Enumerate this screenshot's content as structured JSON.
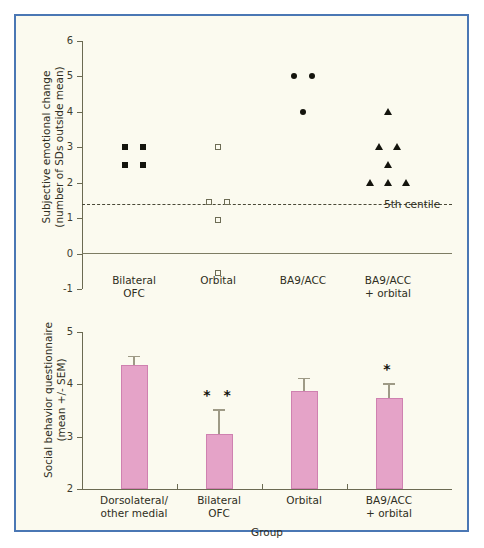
{
  "figure": {
    "background_color": "#fbfaef",
    "border_color": "#4a77b4",
    "bar_color": "#e5a3c8"
  },
  "chart_data": [
    {
      "type": "scatter",
      "title": "",
      "xlabel": "",
      "ylabel": "Subjective emotional change (number of SDs outside mean)",
      "ylabel_line1": "Subjective emotional change",
      "ylabel_line2": "(number of SDs outside mean)",
      "ylim": [
        -1,
        6
      ],
      "yticks": [
        6,
        5,
        4,
        3,
        2,
        1,
        0,
        -1
      ],
      "ytick_labels": [
        "6",
        "5",
        "4",
        "3",
        "2",
        "1",
        "0",
        "-1"
      ],
      "grid": false,
      "categories": [
        "Bilateral OFC",
        "Orbital",
        "BA9/ACC",
        "BA9/ACC + orbital"
      ],
      "category_labels": [
        {
          "line1": "Bilateral",
          "line2": "OFC"
        },
        {
          "line1": "Orbital",
          "line2": ""
        },
        {
          "line1": "BA9/ACC",
          "line2": ""
        },
        {
          "line1": "BA9/ACC",
          "line2": "+ orbital"
        }
      ],
      "annotations": [
        {
          "text": "5th centile",
          "y": 1.7,
          "type": "dashed-reference-line"
        }
      ],
      "reference_line_value": 1.7,
      "zero_line_value": 0,
      "series": [
        {
          "name": "Bilateral OFC",
          "marker": "filled-square",
          "points": [
            {
              "x": 1,
              "y": 3.0,
              "offset": -1
            },
            {
              "x": 1,
              "y": 3.0,
              "offset": 1
            },
            {
              "x": 1,
              "y": 2.5,
              "offset": -1
            },
            {
              "x": 1,
              "y": 2.5,
              "offset": 1
            }
          ]
        },
        {
          "name": "Orbital",
          "marker": "open-square",
          "points": [
            {
              "x": 2,
              "y": 3.0,
              "offset": 0
            },
            {
              "x": 2,
              "y": 1.45,
              "offset": -1
            },
            {
              "x": 2,
              "y": 1.45,
              "offset": 1
            },
            {
              "x": 2,
              "y": 0.95,
              "offset": 0
            },
            {
              "x": 2,
              "y": -0.55,
              "offset": 0
            }
          ]
        },
        {
          "name": "BA9/ACC",
          "marker": "filled-circle",
          "points": [
            {
              "x": 3,
              "y": 5.0,
              "offset": -1
            },
            {
              "x": 3,
              "y": 5.0,
              "offset": 1
            },
            {
              "x": 3,
              "y": 4.0,
              "offset": 0
            }
          ]
        },
        {
          "name": "BA9/ACC + orbital",
          "marker": "filled-triangle",
          "points": [
            {
              "x": 4,
              "y": 4.0,
              "offset": 0
            },
            {
              "x": 4,
              "y": 3.0,
              "offset": -1
            },
            {
              "x": 4,
              "y": 3.0,
              "offset": 1
            },
            {
              "x": 4,
              "y": 2.5,
              "offset": 0
            },
            {
              "x": 4,
              "y": 2.0,
              "offset": -2
            },
            {
              "x": 4,
              "y": 2.0,
              "offset": 0
            },
            {
              "x": 4,
              "y": 2.0,
              "offset": 2
            }
          ]
        }
      ]
    },
    {
      "type": "bar",
      "title": "",
      "xlabel": "Group",
      "ylabel": "Social behavior questionnaire (mean +/- SEM)",
      "ylabel_line1": "Social behavior questionnaire",
      "ylabel_line2": "(mean +/- SEM)",
      "ylim": [
        2,
        5
      ],
      "yticks": [
        5,
        4,
        3,
        2
      ],
      "ytick_labels": [
        "5",
        "4",
        "3",
        "2"
      ],
      "grid": false,
      "categories": [
        "Dorsolateral/other medial",
        "Bilateral OFC",
        "Orbital",
        "BA9/ACC + orbital"
      ],
      "category_labels": [
        {
          "line1": "Dorsolateral/",
          "line2": "other medial"
        },
        {
          "line1": "Bilateral",
          "line2": "OFC"
        },
        {
          "line1": "Orbital",
          "line2": ""
        },
        {
          "line1": "BA9/ACC",
          "line2": "+ orbital"
        }
      ],
      "values": [
        4.36,
        3.06,
        3.87,
        3.73
      ],
      "errors": [
        0.19,
        0.46,
        0.25,
        0.29
      ],
      "significance": [
        "",
        "* *",
        "",
        "*"
      ]
    }
  ]
}
